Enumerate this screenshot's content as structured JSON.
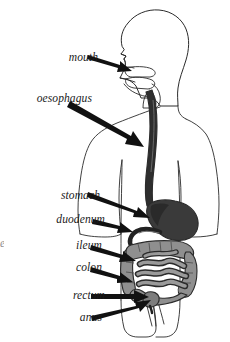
{
  "figure": {
    "background_color": "#ffffff",
    "outline_color": "#2b2b2b",
    "arrow_color": "#111111",
    "stomach_color": "#3a3a3a",
    "oesophagus_color": "#2e2e2e",
    "intestine_fill": "#949494",
    "intestine_dark": "#6d6d6d",
    "label_color": "#1a1a1a"
  },
  "labels": {
    "mouth": "mouth",
    "oesophagus": "oesophagus",
    "stomach": "stomach",
    "duodenum": "duodenum",
    "ileum": "ileum",
    "colon": "colon",
    "rectum": "rectum",
    "anus": "anus",
    "clipped_edge_fragment": "e"
  },
  "parts": [
    {
      "id": "mouth",
      "label": "mouth",
      "arrow_from": [
        88,
        57
      ],
      "arrow_to": [
        131,
        72
      ]
    },
    {
      "id": "oesophagus",
      "label": "oesophagus",
      "arrow_from": [
        72,
        104
      ],
      "arrow_to": [
        143,
        146
      ]
    },
    {
      "id": "stomach",
      "label": "stomach",
      "arrow_from": [
        88,
        194
      ],
      "arrow_to": [
        148,
        217
      ]
    },
    {
      "id": "duodenum",
      "label": "duodenum",
      "arrow_from": [
        92,
        221
      ],
      "arrow_to": [
        131,
        231
      ]
    },
    {
      "id": "ileum",
      "label": "ileum",
      "arrow_from": [
        90,
        247
      ],
      "arrow_to": [
        133,
        260
      ]
    },
    {
      "id": "colon",
      "label": "colon",
      "arrow_from": [
        90,
        269
      ],
      "arrow_to": [
        131,
        281
      ]
    },
    {
      "id": "rectum",
      "label": "rectum",
      "arrow_from": [
        90,
        296
      ],
      "arrow_to": [
        147,
        296
      ]
    },
    {
      "id": "anus",
      "label": "anus",
      "arrow_from": [
        90,
        318
      ],
      "arrow_to": [
        148,
        301
      ]
    }
  ]
}
